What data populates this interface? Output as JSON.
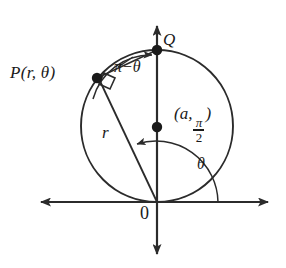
{
  "figure": {
    "stroke_color": "#2b2b2b",
    "background_color": "#ffffff"
  },
  "labels": {
    "point_p": "P(r, θ)",
    "point_q": "Q",
    "arc_angle": "π−θ",
    "radius": "r",
    "theta": "θ",
    "origin": "0",
    "center_open": "(a,",
    "center_num": "π",
    "center_den": "2",
    "center_close": ")"
  },
  "geometry": {
    "origin": {
      "x": 157,
      "y": 202
    },
    "circle": {
      "cx": 157,
      "cy": 126,
      "r": 76
    },
    "point_q": {
      "x": 157,
      "y": 50
    },
    "point_p": {
      "x": 97,
      "y": 78
    },
    "center_point": {
      "x": 157,
      "y": 127
    },
    "x_axis": {
      "x1": 33,
      "x2": 275,
      "y": 202
    },
    "y_axis": {
      "x": 157,
      "y1": 18,
      "y2": 262
    }
  }
}
